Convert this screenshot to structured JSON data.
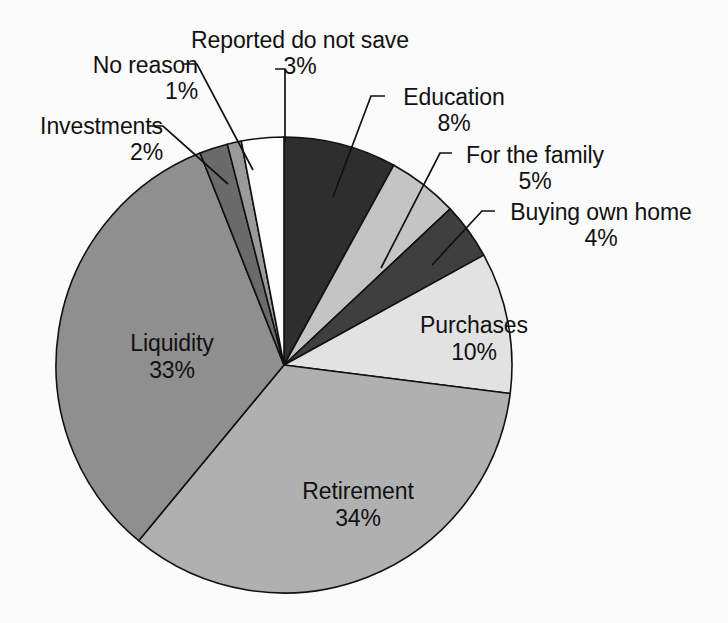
{
  "figure": {
    "background_color": "#fbfbfb",
    "text_color": "#111111",
    "outline_color": "#111111"
  },
  "chart_data": {
    "type": "pie",
    "title": "",
    "subtitle": "",
    "xlabel": "",
    "ylabel": "",
    "legend_position": "none",
    "grid": false,
    "units": "percent",
    "start_angle_deg": 0,
    "direction": "clockwise",
    "center": {
      "x": 284,
      "y": 365
    },
    "radius": 228,
    "categories": [
      "Education",
      "For the family",
      "Buying own home",
      "Purchases",
      "Retirement",
      "Liquidity",
      "Investments",
      "No reason",
      "Reported do not save"
    ],
    "values": [
      8,
      5,
      4,
      10,
      34,
      33,
      2,
      1,
      3
    ],
    "value_labels": [
      "8%",
      "5%",
      "4%",
      "10%",
      "34%",
      "33%",
      "2%",
      "1%",
      "3%"
    ],
    "colors": [
      "#2e2e2e",
      "#c4c4c4",
      "#3f3f3f",
      "#e2e2e2",
      "#b0b0b0",
      "#8f8f8f",
      "#6a6a6a",
      "#9a9a9a",
      "#fdfdfd"
    ],
    "slices": [
      {
        "label": "Education",
        "value": 8,
        "percent_label": "8%",
        "color": "#2e2e2e",
        "label_placement": "callout"
      },
      {
        "label": "For the family",
        "value": 5,
        "percent_label": "5%",
        "color": "#c4c4c4",
        "label_placement": "callout"
      },
      {
        "label": "Buying own home",
        "value": 4,
        "percent_label": "4%",
        "color": "#3f3f3f",
        "label_placement": "callout"
      },
      {
        "label": "Purchases",
        "value": 10,
        "percent_label": "10%",
        "color": "#e2e2e2",
        "label_placement": "inside"
      },
      {
        "label": "Retirement",
        "value": 34,
        "percent_label": "34%",
        "color": "#b0b0b0",
        "label_placement": "inside"
      },
      {
        "label": "Liquidity",
        "value": 33,
        "percent_label": "33%",
        "color": "#8f8f8f",
        "label_placement": "inside"
      },
      {
        "label": "Investments",
        "value": 2,
        "percent_label": "2%",
        "color": "#6a6a6a",
        "label_placement": "callout"
      },
      {
        "label": "No reason",
        "value": 1,
        "percent_label": "1%",
        "color": "#9a9a9a",
        "label_placement": "callout"
      },
      {
        "label": "Reported do not save",
        "value": 3,
        "percent_label": "3%",
        "color": "#fdfdfd",
        "label_placement": "callout"
      }
    ]
  },
  "labels": {
    "no_reason": {
      "name": "No reason",
      "pct": "1%"
    },
    "reported_do_not_save": {
      "name": "Reported do not save",
      "pct": "3%"
    },
    "investments": {
      "name": "Investments",
      "pct": "2%"
    },
    "education": {
      "name": "Education",
      "pct": "8%"
    },
    "for_the_family": {
      "name": "For the family",
      "pct": "5%"
    },
    "buying_own_home": {
      "name": "Buying own home",
      "pct": "4%"
    },
    "purchases": {
      "name": "Purchases",
      "pct": "10%"
    },
    "liquidity": {
      "name": "Liquidity",
      "pct": "33%"
    },
    "retirement": {
      "name": "Retirement",
      "pct": "34%"
    }
  }
}
